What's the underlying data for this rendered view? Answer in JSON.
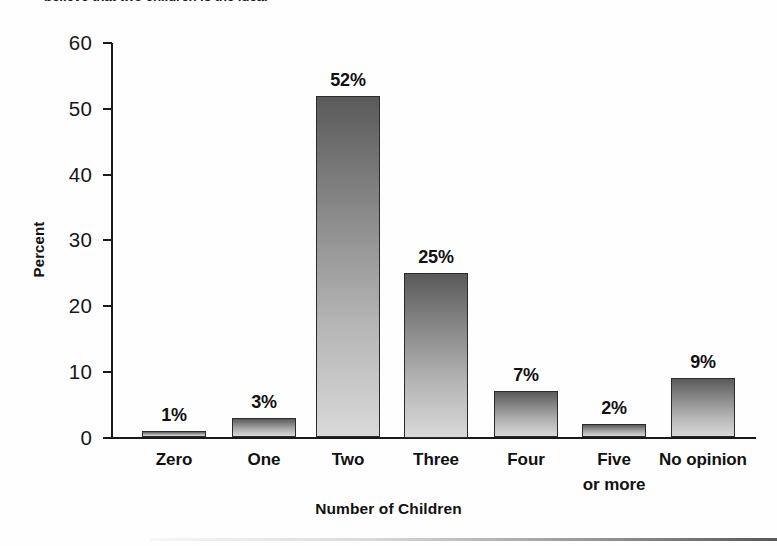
{
  "caption_remnant": "believe that two children is the ideal",
  "chart_data": {
    "type": "bar",
    "title": "",
    "xlabel": "Number of Children",
    "ylabel": "Percent",
    "categories": [
      "Zero",
      "One",
      "Two",
      "Three",
      "Four",
      "Five\nor more",
      "No opinion"
    ],
    "category_lines": [
      [
        "Zero"
      ],
      [
        "One"
      ],
      [
        "Two"
      ],
      [
        "Three"
      ],
      [
        "Four"
      ],
      [
        "Five",
        "or more"
      ],
      [
        "No opinion"
      ]
    ],
    "values": [
      1,
      3,
      52,
      25,
      7,
      2,
      9
    ],
    "data_labels": [
      "1%",
      "3%",
      "52%",
      "25%",
      "7%",
      "2%",
      "9%"
    ],
    "ylim": [
      0,
      60
    ],
    "yticks": [
      0,
      10,
      20,
      30,
      40,
      50,
      60
    ],
    "ytick_labels": [
      "0",
      "10",
      "20",
      "30",
      "40",
      "50",
      "60"
    ],
    "grid": false,
    "legend": false,
    "bar_gradient_top": "#5a5a5a",
    "bar_gradient_bottom": "#d9d9d9",
    "bar_border_color": "#2b2b2b",
    "axis_color": "#1a1a1a",
    "background": "#fefefe"
  }
}
